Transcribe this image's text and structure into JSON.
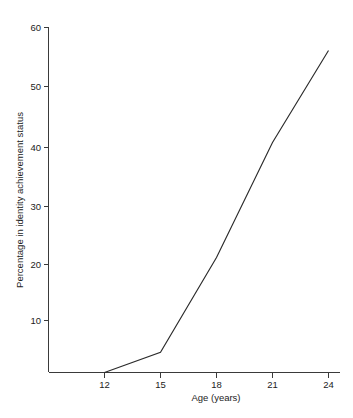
{
  "chart_data": {
    "type": "line",
    "title": "",
    "xlabel": "Age (years)",
    "ylabel": "Percentage in identity achievement status",
    "x": [
      12,
      15,
      18,
      21,
      24
    ],
    "values": [
      0,
      3.5,
      20,
      40,
      56
    ],
    "series": [
      {
        "name": "Identity achievement",
        "x": [
          12,
          15,
          18,
          21,
          24
        ],
        "values": [
          0,
          3.5,
          20,
          40,
          56
        ]
      }
    ],
    "xlim": [
      10.5,
      25
    ],
    "ylim": [
      0,
      60
    ],
    "xticks": [
      12,
      15,
      18,
      21,
      24
    ],
    "xtick_labels": [
      "12",
      "15",
      "18",
      "21",
      "24"
    ],
    "yticks": [
      10,
      20,
      30,
      40,
      50,
      60
    ],
    "ytick_labels": [
      "10",
      "20",
      "30",
      "40",
      "50",
      "60"
    ],
    "grid": false,
    "legend": null,
    "line_color": "#2b2b2b",
    "axis_color": "#3a3a3a",
    "background": "#ffffff"
  },
  "axes": {
    "x_title": "Age (years)",
    "y_title": "Percentage in identity achievement status",
    "x_tick_0": "12",
    "x_tick_1": "15",
    "x_tick_2": "18",
    "x_tick_3": "21",
    "x_tick_4": "24",
    "y_tick_0": "10",
    "y_tick_1": "20",
    "y_tick_2": "30",
    "y_tick_3": "40",
    "y_tick_4": "50",
    "y_tick_5": "60"
  }
}
